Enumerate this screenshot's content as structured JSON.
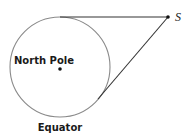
{
  "diagram": {
    "labels": {
      "north_pole": "North Pole",
      "equator": "Equator",
      "point_s": "S"
    },
    "colors": {
      "circle_stroke": "#8a8a8a",
      "line_stroke": "#333333",
      "point_fill": "#111111",
      "text": "#1a1a1a"
    },
    "geometry": {
      "circle": {
        "cx": 60,
        "cy": 67,
        "r": 50
      },
      "center_point": {
        "x": 60,
        "y": 68
      },
      "point_s": {
        "x": 168,
        "y": 17
      },
      "tangent_top": {
        "x": 60,
        "y": 17
      },
      "tangent_bottom": {
        "x": 98,
        "y": 99
      }
    }
  }
}
